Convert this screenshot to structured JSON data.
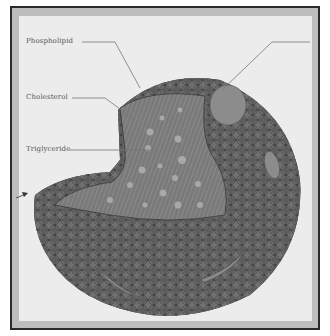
{
  "figure": {
    "labels": {
      "phospholipid": "Phospholipid",
      "cholesterol": "Cholesterol",
      "triglyceride": "Triglyceride",
      "right_label": ""
    },
    "colors": {
      "frame_border": "#2a2a2a",
      "frame_band": "#bdbdbd",
      "background": "#ececec",
      "head": "#6e6e6e",
      "head_outline": "#3a3a3a",
      "tail": "#8a8a8a",
      "protein": "#8c8c8c",
      "core_dot": "#a8a8a8"
    }
  }
}
